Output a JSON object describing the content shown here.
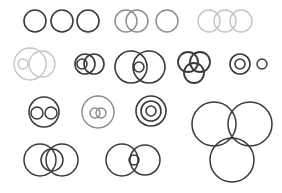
{
  "diagram": {
    "width": 282,
    "height": 193,
    "background": "#ffffff",
    "colors": {
      "dark": "#3a3a3a",
      "mid": "#8a8a8a",
      "light": "#c4c4c4"
    },
    "groups": [
      {
        "name": "three-separate-circles",
        "tone": "dark",
        "stroke": 1.6,
        "circles": [
          {
            "cx": 35,
            "cy": 21,
            "r": 11
          },
          {
            "cx": 62,
            "cy": 21,
            "r": 11
          },
          {
            "cx": 88,
            "cy": 21,
            "r": 11
          }
        ]
      },
      {
        "name": "two-overlapping-circles",
        "tone": "mid",
        "stroke": 1.4,
        "circles": [
          {
            "cx": 126,
            "cy": 21,
            "r": 11
          },
          {
            "cx": 137,
            "cy": 21,
            "r": 11
          }
        ]
      },
      {
        "name": "single-circle",
        "tone": "mid",
        "stroke": 1.4,
        "circles": [
          {
            "cx": 167,
            "cy": 21,
            "r": 11
          }
        ]
      },
      {
        "name": "three-chain-circles",
        "tone": "light",
        "stroke": 1.4,
        "circles": [
          {
            "cx": 209,
            "cy": 21,
            "r": 11
          },
          {
            "cx": 225,
            "cy": 21,
            "r": 11
          },
          {
            "cx": 241,
            "cy": 21,
            "r": 11
          }
        ]
      },
      {
        "name": "circle-with-inner-and-overlap",
        "tone": "light",
        "stroke": 1.4,
        "circles": [
          {
            "cx": 30,
            "cy": 64,
            "r": 16
          },
          {
            "cx": 23,
            "cy": 64,
            "r": 5
          },
          {
            "cx": 42,
            "cy": 64,
            "r": 13
          }
        ]
      },
      {
        "name": "overlap-with-inner-small",
        "tone": "dark",
        "stroke": 1.6,
        "circles": [
          {
            "cx": 85,
            "cy": 64,
            "r": 10
          },
          {
            "cx": 94,
            "cy": 64,
            "r": 10
          },
          {
            "cx": 82,
            "cy": 64,
            "r": 5
          }
        ]
      },
      {
        "name": "large-overlap-with-inner",
        "tone": "dark",
        "stroke": 1.6,
        "circles": [
          {
            "cx": 131,
            "cy": 67,
            "r": 16
          },
          {
            "cx": 149,
            "cy": 67,
            "r": 16
          },
          {
            "cx": 139,
            "cy": 67,
            "r": 5
          }
        ]
      },
      {
        "name": "three-way-venn",
        "tone": "dark",
        "stroke": 1.8,
        "circles": [
          {
            "cx": 188,
            "cy": 62,
            "r": 10
          },
          {
            "cx": 200,
            "cy": 62,
            "r": 10
          },
          {
            "cx": 194,
            "cy": 73,
            "r": 10
          }
        ]
      },
      {
        "name": "concentric-pair",
        "tone": "dark",
        "stroke": 1.6,
        "circles": [
          {
            "cx": 240,
            "cy": 64,
            "r": 10
          },
          {
            "cx": 240,
            "cy": 64,
            "r": 5
          }
        ]
      },
      {
        "name": "small-single-circle",
        "tone": "dark",
        "stroke": 1.4,
        "circles": [
          {
            "cx": 262,
            "cy": 64,
            "r": 5
          }
        ]
      },
      {
        "name": "circle-containing-two-disjoint",
        "tone": "dark",
        "stroke": 1.5,
        "circles": [
          {
            "cx": 44,
            "cy": 112,
            "r": 15
          },
          {
            "cx": 37,
            "cy": 113,
            "r": 6
          },
          {
            "cx": 51,
            "cy": 113,
            "r": 6
          }
        ]
      },
      {
        "name": "circle-containing-two-overlapping",
        "tone": "mid",
        "stroke": 1.4,
        "circles": [
          {
            "cx": 98,
            "cy": 112,
            "r": 16
          },
          {
            "cx": 95,
            "cy": 113,
            "r": 5
          },
          {
            "cx": 101,
            "cy": 113,
            "r": 5
          }
        ]
      },
      {
        "name": "three-concentric",
        "tone": "dark",
        "stroke": 1.6,
        "circles": [
          {
            "cx": 151,
            "cy": 111,
            "r": 15
          },
          {
            "cx": 151,
            "cy": 111,
            "r": 10
          },
          {
            "cx": 151,
            "cy": 111,
            "r": 5
          }
        ]
      },
      {
        "name": "overlap-with-middle-circle",
        "tone": "dark",
        "stroke": 1.5,
        "circles": [
          {
            "cx": 40,
            "cy": 160,
            "r": 16
          },
          {
            "cx": 62,
            "cy": 160,
            "r": 16
          },
          {
            "cx": 52,
            "cy": 160,
            "r": 11
          }
        ]
      },
      {
        "name": "overlap-with-small-lens",
        "tone": "dark",
        "stroke": 1.5,
        "circles": [
          {
            "cx": 122,
            "cy": 160,
            "r": 16
          },
          {
            "cx": 145,
            "cy": 160,
            "r": 15
          },
          {
            "cx": 134,
            "cy": 160,
            "r": 5
          }
        ]
      },
      {
        "name": "large-three-circle-cluster",
        "tone": "dark",
        "stroke": 1.5,
        "circles": [
          {
            "cx": 214,
            "cy": 124,
            "r": 22
          },
          {
            "cx": 250,
            "cy": 124,
            "r": 22
          },
          {
            "cx": 232,
            "cy": 160,
            "r": 22
          }
        ]
      }
    ]
  }
}
